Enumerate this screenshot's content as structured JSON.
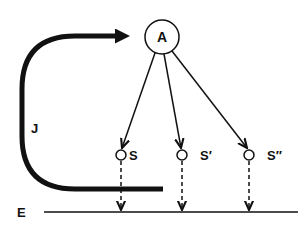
{
  "diagram": {
    "center_node": {
      "label": "A"
    },
    "states": [
      {
        "label": "S"
      },
      {
        "label": "S′"
      },
      {
        "label": "S″"
      }
    ],
    "loop_label": "J",
    "baseline_label": "E",
    "colors": {
      "stroke": "#111111",
      "background": "#ffffff"
    }
  }
}
